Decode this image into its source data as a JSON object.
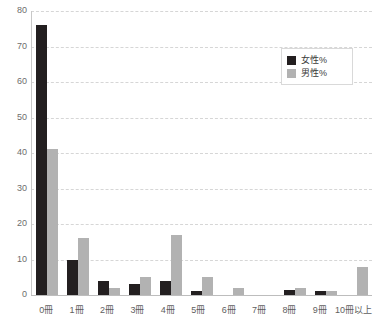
{
  "chart_data": {
    "type": "bar",
    "title": "",
    "xlabel": "",
    "ylabel": "",
    "ylim": [
      0,
      80
    ],
    "yticks": [
      0,
      10,
      20,
      30,
      40,
      50,
      60,
      70,
      80
    ],
    "grid": true,
    "legend_position": "top-right",
    "categories": [
      "0冊",
      "1冊",
      "2冊",
      "3冊",
      "4冊",
      "5冊",
      "6冊",
      "7冊",
      "8冊",
      "9冊",
      "10冊以上"
    ],
    "series": [
      {
        "name": "女性%",
        "color": "#231f20",
        "values": [
          76,
          10,
          4,
          3,
          4,
          1,
          0,
          0,
          1.5,
          1,
          0
        ]
      },
      {
        "name": "男性%",
        "color": "#b2b2b2",
        "values": [
          41,
          16,
          2,
          5,
          17,
          5,
          2,
          0,
          2,
          1,
          8
        ]
      }
    ]
  },
  "legend": {
    "items": [
      {
        "label": "女性%",
        "swatch": "black-square-icon"
      },
      {
        "label": "男性%",
        "swatch": "gray-square-icon"
      }
    ]
  }
}
